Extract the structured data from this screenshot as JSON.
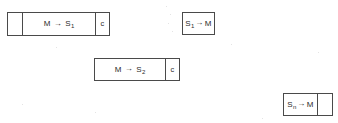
{
  "diagram": {
    "background_color": "#ffffff",
    "stroke_color": "#4a4a4a",
    "text_color": "#2b2b2b",
    "arrow_glyph": "→",
    "packets": [
      {
        "id": "packet-m-to-s1",
        "x": 7,
        "y": 12,
        "height": 24,
        "cells": [
          {
            "name": "empty-prefix-cell",
            "width": 16,
            "text": ""
          },
          {
            "name": "message-cell",
            "width": 74,
            "base": "M",
            "arrow": "→",
            "target": "S",
            "subscript": "1",
            "text": "M → S1",
            "spaced": true
          },
          {
            "name": "checksum-cell",
            "width": 15,
            "text": "c"
          }
        ]
      },
      {
        "id": "packet-s1-to-m",
        "x": 182,
        "y": 12,
        "height": 23,
        "cells": [
          {
            "name": "message-cell",
            "width": 33,
            "base": "S",
            "subscript": "1",
            "arrow": "→",
            "target": "M",
            "text": "S1→M",
            "spaced": false
          }
        ]
      },
      {
        "id": "packet-m-to-s2",
        "x": 94,
        "y": 58,
        "height": 23,
        "cells": [
          {
            "name": "message-cell",
            "width": 72,
            "base": "M",
            "arrow": "→",
            "target": "S",
            "subscript": "2",
            "text": "M → S2",
            "spaced": true
          },
          {
            "name": "checksum-cell",
            "width": 15,
            "text": "c"
          }
        ]
      },
      {
        "id": "packet-sn-to-m",
        "x": 283,
        "y": 93,
        "height": 23,
        "cells": [
          {
            "name": "message-cell",
            "width": 35,
            "base": "S",
            "subscript": "n",
            "arrow": "→",
            "target": "M",
            "text": "Sn→M",
            "spaced": false
          },
          {
            "name": "empty-suffix-cell",
            "width": 16,
            "text": ""
          }
        ]
      }
    ],
    "specks": [
      {
        "x": 166,
        "y": 6,
        "size": 1
      },
      {
        "x": 170,
        "y": 14,
        "size": 1
      },
      {
        "x": 168,
        "y": 23,
        "size": 1
      },
      {
        "x": 172,
        "y": 31,
        "size": 1
      },
      {
        "x": 56,
        "y": 47,
        "size": 1
      },
      {
        "x": 231,
        "y": 44,
        "size": 1
      },
      {
        "x": 95,
        "y": 112,
        "size": 1
      },
      {
        "x": 262,
        "y": 118,
        "size": 1
      },
      {
        "x": 22,
        "y": 104,
        "size": 1
      },
      {
        "x": 318,
        "y": 52,
        "size": 1
      }
    ]
  }
}
